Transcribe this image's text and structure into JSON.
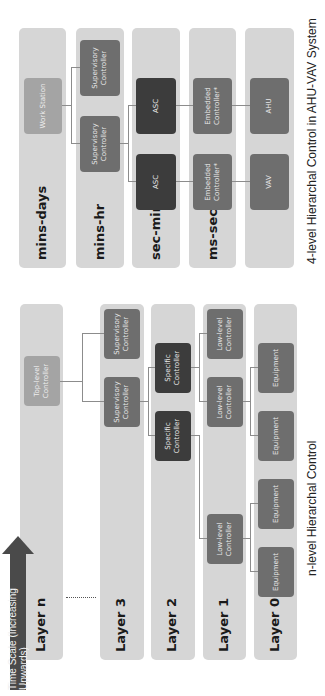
{
  "figure_right": {
    "caption": "4-level Hierarchal Control in AHU-VAV System",
    "rows": [
      {
        "label": "mins-days"
      },
      {
        "label": "mins-hr"
      },
      {
        "label": "sec-min"
      },
      {
        "label": "ms-sec"
      },
      {
        "label": ""
      }
    ],
    "nodes": {
      "work_station": "Work Station",
      "supervisory_1": "Supervisory Controller",
      "supervisory_2": "Supervisory Controller",
      "asc_1": "ASC",
      "asc_2": "ASC",
      "embedded_1": "Embedded Controller*",
      "embedded_2": "Embedded Controller*",
      "vav": "VAV",
      "ahu": "AHU"
    }
  },
  "figure_left": {
    "caption": "n-level Hierarchal Control",
    "rows": [
      {
        "label": "Layer n"
      },
      {
        "label": "Layer 3"
      },
      {
        "label": "Layer 2"
      },
      {
        "label": "Layer 1"
      },
      {
        "label": "Layer 0"
      }
    ],
    "nodes": {
      "top_level": "Top-level Controller",
      "supervisory_1": "Supervisory Controller",
      "supervisory_2": "Supervisory Controller",
      "specific_1": "Specific Controller",
      "specific_2": "Specific Controller",
      "lowlevel_1": "Low-level Controller",
      "lowlevel_2": "Low-level Controller",
      "lowlevel_3": "Low-level Controller",
      "equipment_1": "Equipment",
      "equipment_2": "Equipment",
      "equipment_3": "Equipment",
      "equipment_4": "Equipment",
      "equipment_5": "Equipment"
    },
    "time_arrow": "Time Scale (Increasing Upwards)"
  }
}
